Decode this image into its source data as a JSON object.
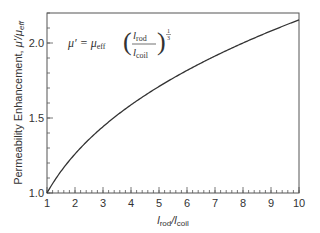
{
  "chart_data": {
    "type": "line",
    "title": "",
    "xlabel": "l_rod/l_coil",
    "ylabel": "Permeability Enhancement, μ'/μ_eff",
    "xlim": [
      1,
      10
    ],
    "ylim": [
      1.0,
      2.2
    ],
    "x_ticks": [
      1,
      2,
      3,
      4,
      5,
      6,
      7,
      8,
      9,
      10
    ],
    "x_tick_labels": [
      "1",
      "2",
      "3",
      "4",
      "5",
      "6",
      "7",
      "8",
      "9",
      "10"
    ],
    "x_minor_step": 0.2,
    "y_ticks": [
      1.0,
      1.5,
      2.0
    ],
    "y_tick_labels": [
      "1.0",
      "1.5",
      "2.0"
    ],
    "y_minor_step": 0.1,
    "grid": false,
    "legend": null,
    "annotation": "μ' = μ_eff (l_rod / l_coil)^(1/3)",
    "series": [
      {
        "name": "μ'/μ_eff",
        "color": "#333333",
        "x": [
          1,
          1.5,
          2,
          2.5,
          3,
          3.5,
          4,
          4.5,
          5,
          5.5,
          6,
          6.5,
          7,
          7.5,
          8,
          8.5,
          9,
          9.5,
          10
        ],
        "y": [
          1.0,
          1.145,
          1.26,
          1.357,
          1.442,
          1.518,
          1.587,
          1.651,
          1.71,
          1.765,
          1.817,
          1.866,
          1.913,
          1.957,
          2.0,
          2.041,
          2.08,
          2.118,
          2.154
        ]
      }
    ]
  },
  "labels": {
    "ylabel_main": "Permeability Enhancement, ",
    "ylabel_mu": "μ'/μ",
    "ylabel_sub": "eff",
    "xlabel_l1": "l",
    "xlabel_sub1": "rod",
    "xlabel_slash": "/l",
    "xlabel_sub2": "coil",
    "eq_lhs": "μ′ = μ",
    "eq_sub_eff": "eff",
    "eq_num": "l",
    "eq_num_sub": "rod",
    "eq_den": "l",
    "eq_den_sub": "coil",
    "eq_exp_num": "1",
    "eq_exp_den": "3"
  }
}
